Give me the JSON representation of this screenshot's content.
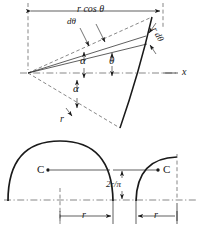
{
  "figure": {
    "ink_color": "#1a1a1a",
    "dash_color": "#555555",
    "background": "#ffffff",
    "top_diagram": {
      "name": "circular-sector-element",
      "labels": {
        "r_cos_theta": "r cos θ",
        "d_theta": "dθ",
        "r_d_theta": "r dθ",
        "alpha_upper": "α",
        "alpha_lower": "α",
        "theta": "θ",
        "r_radius": "r",
        "x_axis": "x"
      }
    },
    "bottom_diagram": {
      "name": "semicircular-areas",
      "labels": {
        "centroid_left": "C",
        "centroid_right": "C",
        "offset": "2r/π",
        "offset_numerator": "2r",
        "offset_denominator": "π",
        "radius_left": "r",
        "radius_right": "r"
      }
    }
  }
}
